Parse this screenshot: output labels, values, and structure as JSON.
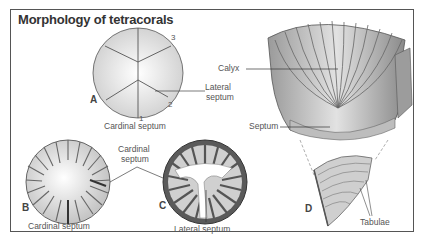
{
  "title": "Morphology of tetracorals",
  "figures": {
    "A": {
      "letter": "A",
      "labels": {
        "lateral_septum": "Lateral",
        "lateral_septum_2": "septum",
        "cardinal_septum": "Cardinal septum"
      },
      "numbers": [
        "1",
        "2",
        "3"
      ]
    },
    "B": {
      "letter": "B",
      "labels": {
        "cardinal_septum": "Cardinal septum"
      }
    },
    "C": {
      "letter": "C",
      "labels": {
        "cardinal_septum_1": "Cardinal",
        "cardinal_septum_2": "septum",
        "lateral_septum": "Lateral septum"
      }
    },
    "D": {
      "letter": "D",
      "labels": {
        "calyx": "Calyx",
        "septum": "Septum",
        "tabulae": "Tabulae"
      }
    }
  },
  "colors": {
    "line": "#444444",
    "shade": "#d8d8d8",
    "dark": "#555555"
  }
}
